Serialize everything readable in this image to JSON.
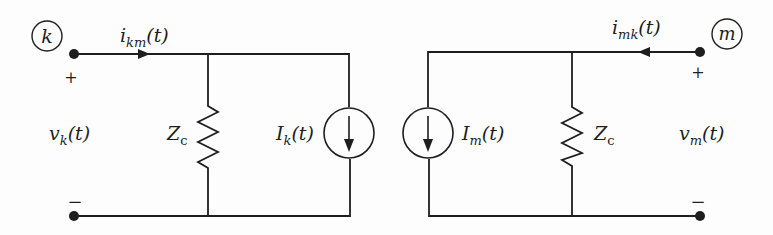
{
  "diagram": {
    "type": "equivalent-circuit",
    "left_node": {
      "name": "k",
      "current": {
        "base": "i",
        "sub": "km",
        "arg": "(t)"
      },
      "voltage": {
        "base": "v",
        "sub": "k",
        "arg": "(t)"
      },
      "plus": "+",
      "minus": "−",
      "impedance": {
        "base": "Z",
        "sub": "c"
      },
      "source": {
        "base": "I",
        "sub": "k",
        "arg": "(t)"
      }
    },
    "right_node": {
      "name": "m",
      "current": {
        "base": "i",
        "sub": "mk",
        "arg": "(t)"
      },
      "voltage": {
        "base": "v",
        "sub": "m",
        "arg": "(t)"
      },
      "plus": "+",
      "minus": "−",
      "impedance": {
        "base": "Z",
        "sub": "c"
      },
      "source": {
        "base": "I",
        "sub": "m",
        "arg": "(t)"
      }
    },
    "color": "#1e1e1e"
  }
}
